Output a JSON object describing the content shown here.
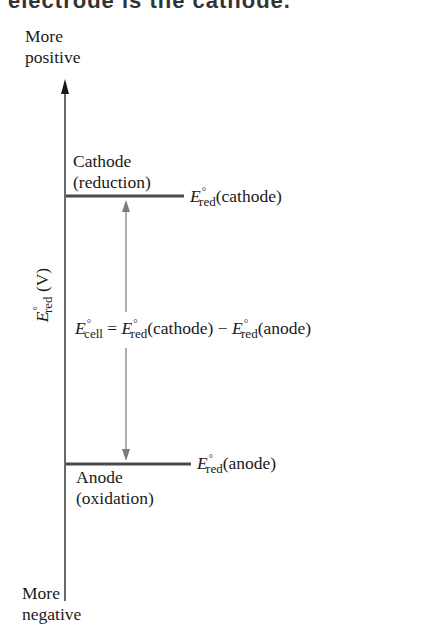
{
  "clipped_header": "electrode is the cathode.",
  "axis": {
    "top_label_line1": "More",
    "top_label_line2": "positive",
    "bottom_label_line1": "More",
    "bottom_label_line2": "negative",
    "ylabel_E": "E",
    "ylabel_sup": "°",
    "ylabel_sub": "red",
    "ylabel_unit": " (V)"
  },
  "cathode": {
    "label_line1": "Cathode",
    "label_line2": "(reduction)",
    "E": "E",
    "sup": "°",
    "sub": "red",
    "paren": "(cathode)"
  },
  "anode": {
    "label_line1": "Anode",
    "label_line2": "(oxidation)",
    "E": "E",
    "sup": "°",
    "sub": "red",
    "paren": "(anode)"
  },
  "equation": {
    "lhs_E": "E",
    "lhs_sup": "°",
    "lhs_sub": "cell",
    "equals": " = ",
    "t1_E": "E",
    "t1_sup": "°",
    "t1_sub": "red",
    "t1_paren": "(cathode)",
    "minus": " − ",
    "t2_E": "E",
    "t2_sup": "°",
    "t2_sub": "red",
    "t2_paren": "(anode)"
  },
  "colors": {
    "axis": "#1a1a1a",
    "level_line": "#4a4a4a",
    "double_arrow": "#7a7a7a"
  }
}
